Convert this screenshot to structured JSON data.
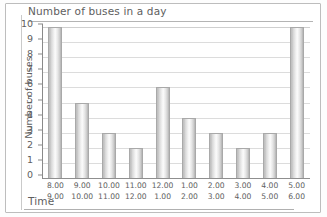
{
  "chart_data": {
    "type": "bar",
    "title": "Number of buses in a day",
    "xlabel": "Time",
    "ylabel": "Number of buses",
    "ylim": [
      0,
      10
    ],
    "grid": true,
    "legend": "none",
    "categories": [
      "8.00 9.00",
      "9.00 10.00",
      "10.00 11.00",
      "11.00 12.00",
      "12.00 1.00",
      "1.00 2.00",
      "2.00 3.00",
      "3.00 4.00",
      "4.00 5.00",
      "5.00 6.00"
    ],
    "category_lines": [
      {
        "start": "8.00",
        "end": "9.00"
      },
      {
        "start": "9.00",
        "end": "10.00"
      },
      {
        "start": "10.00",
        "end": "11.00"
      },
      {
        "start": "11.00",
        "end": "12.00"
      },
      {
        "start": "12.00",
        "end": "1.00"
      },
      {
        "start": "1.00",
        "end": "2.00"
      },
      {
        "start": "2.00",
        "end": "3.00"
      },
      {
        "start": "3.00",
        "end": "4.00"
      },
      {
        "start": "4.00",
        "end": "5.00"
      },
      {
        "start": "5.00",
        "end": "6.00"
      }
    ],
    "values": [
      10,
      5,
      3,
      2,
      6,
      4,
      3,
      2,
      3,
      10
    ],
    "yticks": [
      "0",
      "1",
      "2",
      "3",
      "4",
      "5",
      "6",
      "7",
      "8",
      "9",
      "10"
    ],
    "colors": {
      "bar_fill": "#e3e3e3",
      "bar_edge": "#a9a9a9",
      "gridline": "#dcdcdc",
      "axis": "#8a8a8a",
      "text": "#5e5e5e",
      "frame": "#bdbdbd"
    }
  }
}
